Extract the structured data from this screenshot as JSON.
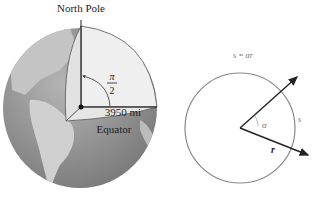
{
  "figure_left": {
    "title": "Earth radius diagram",
    "labels": {
      "north_pole": "North Pole",
      "angle_num": "π",
      "angle_den": "2",
      "radius": "3950 mi",
      "equator": "Equator"
    },
    "colors": {
      "ocean": "#8a8a8a",
      "land": "#c8c8c8",
      "wedge": "#ededed",
      "line": "#222222"
    }
  },
  "figure_right": {
    "title": "Arc length diagram",
    "labels": {
      "formula": "s = αr",
      "arc": "s",
      "angle": "α",
      "radius": "r"
    },
    "colors": {
      "circle": "#888888",
      "arrow": "#222222"
    }
  }
}
